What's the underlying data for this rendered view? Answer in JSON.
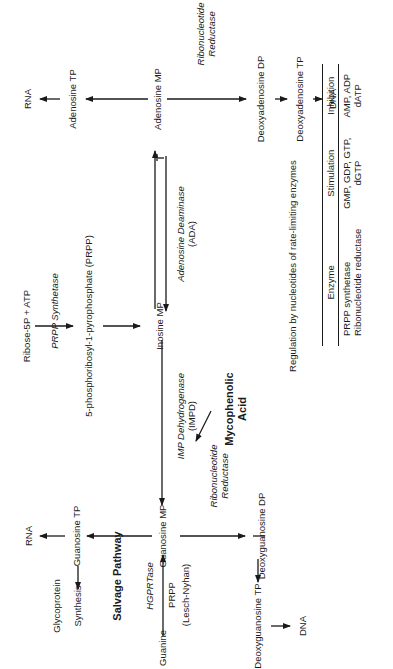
{
  "nodes": {
    "ribose": "Ribose-5P + ATP",
    "prpp_synthetase": "PRPP Synthetase",
    "prpp": "5-phosphoribosyl-1-pyrophosphate (PRPP)",
    "imp": "Inosine MP",
    "amp": "Adenosine MP",
    "atp": "Adenosine TP",
    "rna_top": "RNA",
    "ada_line1": "Adenosine Deaminase",
    "ada_line2": "(ADA)",
    "rr_top_line1": "Ribonucleotide",
    "rr_top_line2": "Reductase",
    "dadp": "Deoxyadenosine DP",
    "datp": "Deoxyadenosine TP",
    "dna_top": "DNA",
    "impd_line1": "IMP Dehydrogenase",
    "impd_line2": "(IMPD)",
    "myco_line1": "Mycophenolic",
    "myco_line2": "Acid",
    "gmp": "Guanosine MP",
    "gtp": "Guanosine TP",
    "rna_bottom": "RNA",
    "synthesis": "Synthesis",
    "glycoprotein": "Glycoprotein",
    "salvage": "Salvage Pathway",
    "hgprtase": "HGPRTase",
    "prpp_small": "PRPP",
    "lesch": "(Lesch-Nyhan)",
    "guanine": "Guanine",
    "rr_bottom_line1": "Ribonucleotide",
    "rr_bottom_line2": "Reductase",
    "dgdp": "Deoxyguanosine DP",
    "dgtp": "Deoxyguanosine TP",
    "dna_bottom": "DNA"
  },
  "regulation_table": {
    "caption": "Regulation by nucleotides of rate-limiting enzymes",
    "headers": [
      "Enzyme",
      "Stimulation",
      "Inhibition"
    ],
    "rows": [
      [
        "PRPP synthetase",
        "GMP, GDP, GTP,",
        "AMP, ADP"
      ],
      [
        "Ribonucleotide reductase",
        "dGTP",
        "dATP"
      ]
    ]
  }
}
